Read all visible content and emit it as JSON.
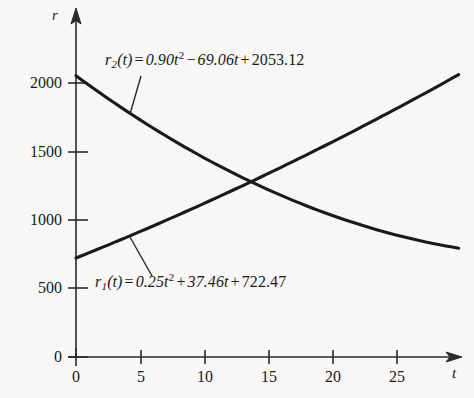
{
  "figure": {
    "background_color": "#f8f7f5",
    "ink_color": "#1a1a1a"
  },
  "axes": {
    "y_axis_name": "r",
    "x_axis_name": "t",
    "x_ticks": [
      "0",
      "5",
      "10",
      "15",
      "20",
      "25"
    ],
    "y_ticks": [
      "0",
      "500",
      "1000",
      "1500",
      "2000"
    ]
  },
  "equations": {
    "r1": {
      "name": "r",
      "sub": "1",
      "arg": "(t)",
      "eq": "=",
      "a_term": "0.25t",
      "a_pow": "2",
      "op1": "+",
      "b_term": "37.46t",
      "op2": "+",
      "c_term": "722.47",
      "plain": "r1(t) = 0.25t^2 + 37.46t + 722.47"
    },
    "r2": {
      "name": "r",
      "sub": "2",
      "arg": "(t)",
      "eq": "=",
      "a_term": "0.90t",
      "a_pow": "2",
      "op1": "−",
      "b_term": "69.06t",
      "op2": "+",
      "c_term": "2053.12",
      "plain": "r2(t) = 0.90t^2 - 69.06t + 2053.12"
    }
  },
  "chart_data": {
    "type": "line",
    "title": "",
    "xlabel": "t",
    "ylabel": "r",
    "xlim": [
      0,
      29.8
    ],
    "ylim": [
      0,
      2150
    ],
    "xticks": [
      0,
      5,
      10,
      15,
      20,
      25
    ],
    "yticks": [
      0,
      500,
      1000,
      1500,
      2000
    ],
    "grid": false,
    "legend": "none",
    "annotations": [
      "r2(t) = 0.90t^2 - 69.06t + 2053.12",
      "r1(t) = 0.25t^2 + 37.46t + 722.47"
    ],
    "intersection": {
      "t": 13.7,
      "r": 1270
    },
    "series": [
      {
        "name": "r1(t) = 0.25t^2 + 37.46t + 722.47",
        "formula": {
          "a": 0.25,
          "b": 37.46,
          "c": 722.47
        },
        "x": [
          0,
          2,
          4,
          6,
          8,
          10,
          12,
          14,
          16,
          18,
          20,
          22,
          24,
          26,
          28,
          29.8
        ],
        "values": [
          722.47,
          798.39,
          876.31,
          956.23,
          1038.15,
          1112.07,
          1207.99,
          1296.91,
          1385.83,
          1476.75,
          1571.67,
          1667.59,
          1765.51,
          1865.43,
          1967.35,
          2062.0
        ]
      },
      {
        "name": "r2(t) = 0.90t^2 - 69.06t + 2053.12",
        "formula": {
          "a": 0.9,
          "b": -69.06,
          "c": 2053.12
        },
        "x": [
          0,
          2,
          4,
          6,
          8,
          10,
          12,
          14,
          16,
          18,
          20,
          22,
          24,
          26,
          28,
          29.8
        ],
        "values": [
          2053.12,
          1918.6,
          1791.28,
          1671.16,
          1558.24,
          1452.52,
          1354.0,
          1262.68,
          1178.56,
          1101.64,
          1031.92,
          969.4,
          914.08,
          865.96,
          825.04,
          794.2
        ]
      }
    ]
  }
}
